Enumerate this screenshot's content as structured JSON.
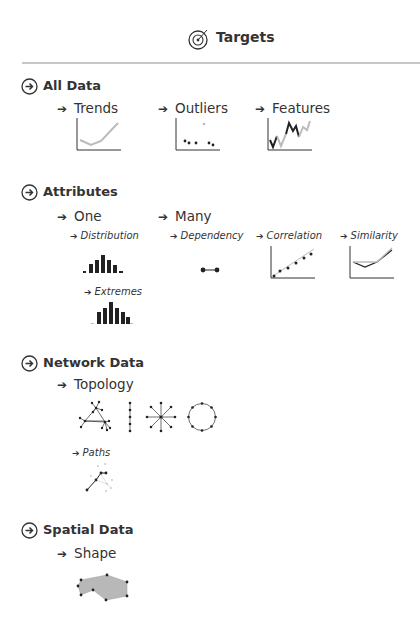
{
  "header": {
    "title": "Targets",
    "icon": "target-icon"
  },
  "sections": {
    "all_data": {
      "label": "All Data",
      "icon": "arrow-circle-icon",
      "items": [
        {
          "label": "Trends",
          "icon": "trend-line-chart-icon"
        },
        {
          "label": "Outliers",
          "icon": "outlier-scatter-icon"
        },
        {
          "label": "Features",
          "icon": "features-line-icon"
        }
      ]
    },
    "attributes": {
      "label": "Attributes",
      "icon": "arrow-circle-icon",
      "one": {
        "label": "One",
        "items": [
          {
            "label": "Distribution",
            "icon": "distribution-histogram-icon"
          },
          {
            "label": "Extremes",
            "icon": "extremes-histogram-icon"
          }
        ]
      },
      "many": {
        "label": "Many",
        "items": [
          {
            "label": "Dependency",
            "icon": "dependency-link-icon"
          },
          {
            "label": "Correlation",
            "icon": "correlation-scatter-icon"
          },
          {
            "label": "Similarity",
            "icon": "similarity-line-icon"
          }
        ]
      }
    },
    "network_data": {
      "label": "Network Data",
      "icon": "arrow-circle-icon",
      "topology": {
        "label": "Topology",
        "icons": [
          "network-graph-icon",
          "line-topology-icon",
          "star-topology-icon",
          "ring-topology-icon"
        ]
      },
      "paths": {
        "label": "Paths",
        "icon": "path-graph-icon"
      }
    },
    "spatial_data": {
      "label": "Spatial Data",
      "icon": "arrow-circle-icon",
      "shape": {
        "label": "Shape",
        "icon": "polygon-shape-icon"
      }
    }
  },
  "colors": {
    "text": "#333333",
    "mark_dark": "#222222",
    "mark_light": "#bbbbbb",
    "shape_fill": "#b8b8b8",
    "rule": "#c8c8c8"
  }
}
